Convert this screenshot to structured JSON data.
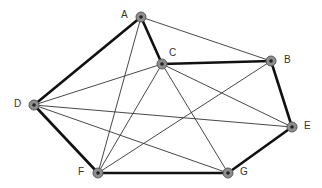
{
  "diagram": {
    "type": "graph",
    "nodes": [
      {
        "id": "A",
        "label": "A",
        "x": 141,
        "y": 17,
        "lx": 121,
        "ly": 10
      },
      {
        "id": "B",
        "label": "B",
        "x": 271,
        "y": 61,
        "lx": 284,
        "ly": 55
      },
      {
        "id": "C",
        "label": "C",
        "x": 162,
        "y": 64,
        "lx": 169,
        "ly": 48
      },
      {
        "id": "D",
        "label": "D",
        "x": 34,
        "y": 105,
        "lx": 14,
        "ly": 99
      },
      {
        "id": "E",
        "label": "E",
        "x": 292,
        "y": 127,
        "lx": 304,
        "ly": 121
      },
      {
        "id": "F",
        "label": "F",
        "x": 98,
        "y": 173,
        "lx": 78,
        "ly": 167
      },
      {
        "id": "G",
        "label": "G",
        "x": 228,
        "y": 173,
        "lx": 240,
        "ly": 167
      }
    ],
    "thick_edges": [
      [
        "A",
        "D"
      ],
      [
        "A",
        "C"
      ],
      [
        "C",
        "B"
      ],
      [
        "B",
        "E"
      ],
      [
        "E",
        "G"
      ],
      [
        "G",
        "F"
      ],
      [
        "F",
        "D"
      ]
    ],
    "thin_edges": [
      [
        "A",
        "B"
      ],
      [
        "A",
        "F"
      ],
      [
        "D",
        "C"
      ],
      [
        "D",
        "E"
      ],
      [
        "D",
        "G"
      ],
      [
        "F",
        "C"
      ],
      [
        "F",
        "B"
      ],
      [
        "C",
        "E"
      ],
      [
        "C",
        "G"
      ]
    ]
  }
}
